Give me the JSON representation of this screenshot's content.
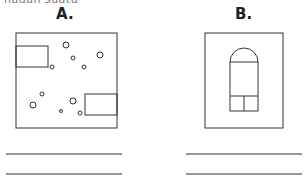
{
  "header_fragment": "nadan suatu",
  "panels": [
    {
      "label": "A.",
      "description": "Floor plan with two rectangles and scattered circles",
      "answer_lines": 2
    },
    {
      "label": "B.",
      "description": "Floor plan with arched-top rectangle divided into sections",
      "answer_lines": 2
    }
  ],
  "colors": {
    "stroke": "#333333",
    "background": "#ffffff"
  }
}
